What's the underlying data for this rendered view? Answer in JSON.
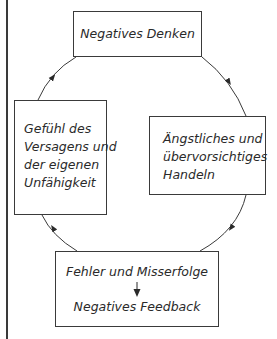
{
  "diagram": {
    "type": "cycle",
    "nodes": {
      "top": {
        "lines": [
          "Negatives Denken"
        ]
      },
      "right": {
        "lines": [
          "Ängstliches und",
          "übervorsichtiges",
          "Handeln"
        ]
      },
      "bottom": {
        "lines": [
          "Fehler und Misserfolge",
          "Negatives Feedback"
        ]
      },
      "left": {
        "lines": [
          "Gefühl des",
          "Versagens und",
          "der eigenen",
          "Unfähigkeit"
        ]
      }
    },
    "edges": [
      {
        "from": "top",
        "to": "right",
        "direction": "clockwise"
      },
      {
        "from": "right",
        "to": "bottom",
        "direction": "clockwise"
      },
      {
        "from": "bottom",
        "to": "left",
        "direction": "clockwise"
      },
      {
        "from": "left",
        "to": "top",
        "direction": "clockwise"
      }
    ],
    "colors": {
      "stroke": "#3a3a3a",
      "text": "#2a2a2a",
      "background": "#ffffff"
    }
  }
}
